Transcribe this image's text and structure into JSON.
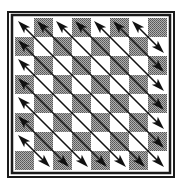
{
  "figure": {
    "title": "",
    "grid": {
      "rows": 8,
      "cols": 8
    },
    "colors": {
      "light_square": "#ffffff",
      "dark_square": "#8c8c8c",
      "border": "#1a1a1a",
      "arrow": "#111111",
      "background": "#ffffff"
    },
    "top_left_square": "light",
    "arrows": {
      "direction": "top-left to bottom-right",
      "count": 13,
      "start_cells": [
        [
          0,
          0
        ],
        [
          1,
          0
        ],
        [
          2,
          0
        ],
        [
          3,
          0
        ],
        [
          4,
          0
        ],
        [
          5,
          0
        ],
        [
          6,
          0
        ],
        [
          0,
          1
        ],
        [
          0,
          2
        ],
        [
          0,
          3
        ],
        [
          0,
          4
        ],
        [
          0,
          5
        ],
        [
          0,
          6
        ]
      ],
      "head_start": "up-left",
      "head_end": "down-right"
    }
  }
}
